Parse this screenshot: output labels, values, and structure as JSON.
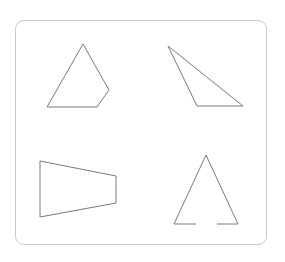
{
  "diagram": {
    "frame": {
      "border_color": "#c9c9c9",
      "radius": 9
    },
    "stroke_color": "#7a7a7a",
    "shapes": [
      {
        "name": "pentagon",
        "type": "polygon",
        "points": "83,44 109,90 97,107 47,107"
      },
      {
        "name": "obtuse-triangle",
        "type": "polygon",
        "points": "168,46 243,106 197,106"
      },
      {
        "name": "trapezoid",
        "type": "polygon",
        "points": "40,161 116,176 116,203 40,217"
      },
      {
        "name": "open-triangle",
        "type": "polyline",
        "segments": [
          "196,224 174,224 206,155 238,224 217,224"
        ]
      }
    ]
  }
}
